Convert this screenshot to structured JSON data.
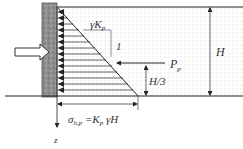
{
  "diagram": {
    "labels": {
      "gamma_kp": "γK",
      "gamma_kp_sub": "p",
      "slope_one": "1",
      "force": "P",
      "force_sub": "p",
      "height": "H",
      "third_height": "H/3",
      "stress_sigma": "σ",
      "stress_sub": "h,p",
      "stress_rhs": " =K",
      "stress_rhs_sub": "p",
      "stress_tail": " γH",
      "depth_axis": "z"
    },
    "colors": {
      "wall": "#8a8a8a",
      "soil_dots": "#9a9a9a",
      "lines": "#222222",
      "text": "#333333"
    }
  }
}
